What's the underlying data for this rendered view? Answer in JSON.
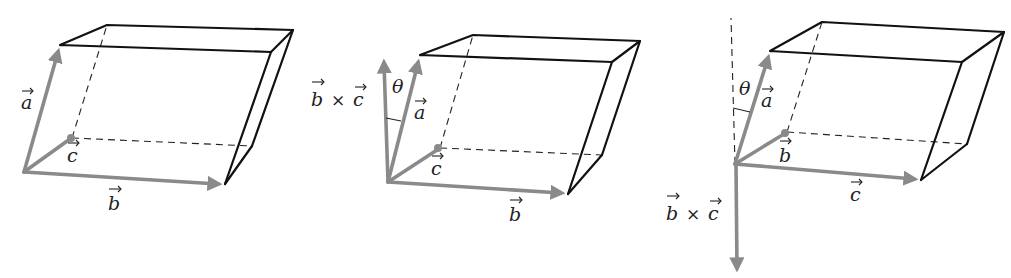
{
  "figures": [
    {
      "id": "fig1",
      "labels": {
        "a": "a",
        "b": "b",
        "c": "c"
      },
      "colors": {
        "edge": "#111111",
        "vector": "#8a8a8a"
      }
    },
    {
      "id": "fig2",
      "labels": {
        "a": "a",
        "b": "b",
        "c": "c",
        "theta": "θ",
        "cross_b": "b",
        "cross_times": "×",
        "cross_c": "c"
      }
    },
    {
      "id": "fig3",
      "labels": {
        "a": "a",
        "b": "b",
        "c": "c",
        "theta": "θ",
        "cross_b": "b",
        "cross_times": "×",
        "cross_c": "c"
      }
    }
  ]
}
